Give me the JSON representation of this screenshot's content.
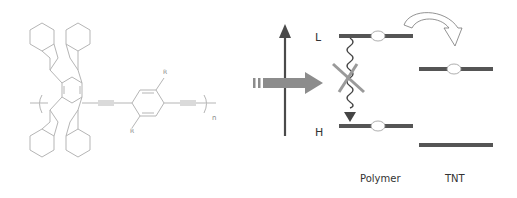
{
  "figure": {
    "molecule": {
      "substituent_top": "R",
      "substituent_bottom": "R",
      "repeat_subscript": "n"
    },
    "energy_diagram": {
      "level_high_label": "L",
      "level_low_label": "H",
      "columns": [
        {
          "label": "Polymer"
        },
        {
          "label": "TNT"
        }
      ]
    },
    "colors": {
      "structure_line": "#b5b5b5",
      "level_bar": "#555555",
      "axis_arrow": "#4a4a4a",
      "excitation_arrow": "#8c8c8c",
      "cross": "#9a9a9a",
      "text": "#333333"
    }
  }
}
